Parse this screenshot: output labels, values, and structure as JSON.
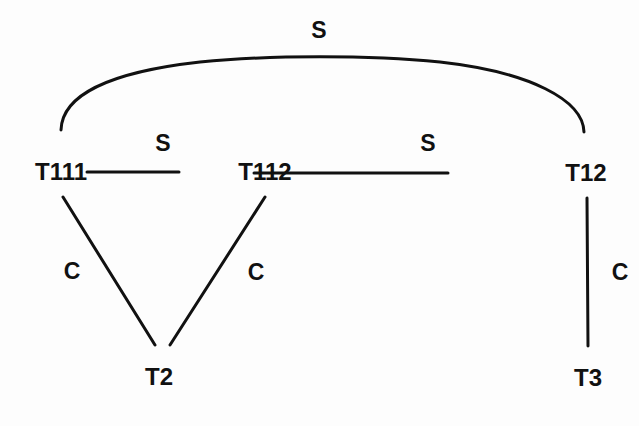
{
  "diagram": {
    "type": "graph",
    "nodes": [
      {
        "id": "T111",
        "label": "T111",
        "x": 61,
        "y": 172
      },
      {
        "id": "T112",
        "label": "T112",
        "x": 265,
        "y": 172
      },
      {
        "id": "T12",
        "label": "T12",
        "x": 587,
        "y": 173
      },
      {
        "id": "T2",
        "label": "T2",
        "x": 159,
        "y": 377
      },
      {
        "id": "T3",
        "label": "T3",
        "x": 588,
        "y": 378
      }
    ],
    "edges": [
      {
        "from": "T111",
        "to": "T12",
        "label": "S",
        "shape": "arc"
      },
      {
        "from": "T111",
        "to": "T112",
        "label": "S",
        "shape": "line"
      },
      {
        "from": "T112",
        "to": "T12",
        "label": "S",
        "shape": "line"
      },
      {
        "from": "T111",
        "to": "T2",
        "label": "C",
        "shape": "line"
      },
      {
        "from": "T112",
        "to": "T2",
        "label": "C",
        "shape": "line"
      },
      {
        "from": "T12",
        "to": "T3",
        "label": "C",
        "shape": "line"
      }
    ],
    "colors": {
      "line": "#111111",
      "text": "#111111",
      "background": "#fdfdfd"
    }
  }
}
